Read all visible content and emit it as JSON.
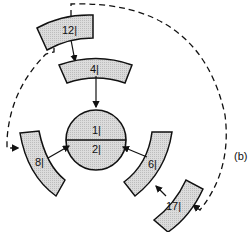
{
  "diagram": {
    "center": {
      "top_label": "1|",
      "bottom_label": "2|"
    },
    "blocks": [
      {
        "id": "block-12",
        "label": "12|"
      },
      {
        "id": "block-4",
        "label": "4|"
      },
      {
        "id": "block-8",
        "label": "8|"
      },
      {
        "id": "block-6",
        "label": "6|"
      },
      {
        "id": "block-17",
        "label": "17|"
      }
    ],
    "annotation": "(b)",
    "colors": {
      "fill": "#d4d4d4",
      "stroke": "#111111",
      "background": "#ffffff"
    }
  }
}
